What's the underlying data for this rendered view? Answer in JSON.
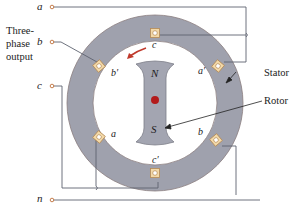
{
  "diagram": {
    "group_label_lines": [
      "Three-",
      "phase",
      "output"
    ],
    "terminals": [
      {
        "id": "a",
        "label": "a"
      },
      {
        "id": "b",
        "label": "b"
      },
      {
        "id": "c",
        "label": "c"
      },
      {
        "id": "n",
        "label": "n"
      }
    ],
    "slots": [
      {
        "id": "c_top",
        "label": "c"
      },
      {
        "id": "a_prime",
        "label": "a′"
      },
      {
        "id": "b_prime",
        "label": "b′"
      },
      {
        "id": "a",
        "label": "a"
      },
      {
        "id": "b",
        "label": "b"
      },
      {
        "id": "c_prime",
        "label": "c′"
      }
    ],
    "rotor": {
      "north_label": "N",
      "south_label": "S"
    },
    "callouts": {
      "stator": "Stator",
      "rotor": "Rotor"
    },
    "colors": {
      "stator_fill": "#9fa1ad",
      "stator_edge": "#8c7f80",
      "rotor_fill": "#a3a5b1",
      "shaft": "#b31b1b",
      "rotation_arrow": "#c0392b",
      "slot_fill": "#f3d9a8",
      "slot_edge": "#b58a55",
      "wire": "#5f6370",
      "terminal": "#c0703a"
    }
  }
}
